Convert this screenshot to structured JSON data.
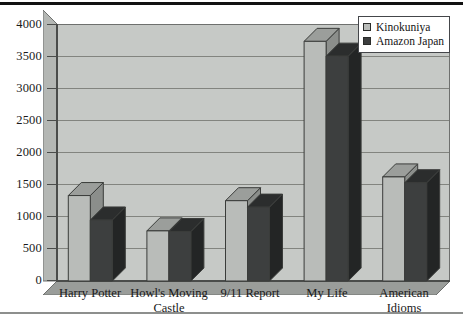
{
  "figure": {
    "background_color": "#ffffff",
    "plot_background_color": "#c6c9c6",
    "gridline_color": "#82847f",
    "axis_color": "#4a4c4a"
  },
  "legend": {
    "position": "top-right",
    "entries": [
      {
        "label": "Kinokuniya",
        "color": "#b9bcb9"
      },
      {
        "label": "Amazon Japan",
        "color": "#3c3e3e"
      }
    ]
  },
  "chart_data": {
    "type": "bar",
    "title": "",
    "subtitle": "",
    "xlabel": "",
    "ylabel": "",
    "grid": true,
    "legend_position": "top-right",
    "style": "3d-clustered-column",
    "categories": [
      "Harry Potter",
      "Howl's Moving\nCastle",
      "9/11 Report",
      "My Life",
      "American\nIdioms"
    ],
    "ylim": [
      0,
      4000
    ],
    "yticks": [
      0,
      500,
      1000,
      1500,
      2000,
      2500,
      3000,
      3500,
      4000
    ],
    "ytick_labels": [
      "0",
      "500",
      "1000",
      "1500",
      "2000",
      "2500",
      "3000",
      "3500",
      "4000"
    ],
    "series": [
      {
        "name": "Kinokuniya",
        "color": "#b9bcb9",
        "values": [
          1330,
          780,
          1250,
          3730,
          1620
        ]
      },
      {
        "name": "Amazon Japan",
        "color": "#3c3e3e",
        "values": [
          950,
          770,
          1150,
          3500,
          1530
        ]
      }
    ]
  }
}
